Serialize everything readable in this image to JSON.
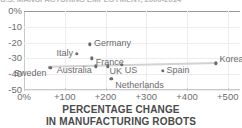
{
  "figure": {
    "title_cut": "U.S. MANUFACTURING EMPLOYMENT, 2000-2014",
    "caption_line1": "PERCENTAGE CHANGE",
    "caption_line2": "IN MANUFACTURING ROBOTS",
    "accent_color": "#6b6b6b",
    "trend_color": "#d2d2d2",
    "grid_color": "#ededed",
    "axis_color": "#c9c9c9"
  },
  "chart_data": {
    "type": "scatter",
    "title": "",
    "xlabel": "PERCENTAGE CHANGE IN MANUFACTURING ROBOTS",
    "ylabel": "",
    "xlim": [
      0,
      530
    ],
    "ylim": [
      -50,
      0
    ],
    "grid": true,
    "legend": "none",
    "xticks": [
      0,
      100,
      200,
      300,
      400,
      500
    ],
    "xticklabels": [
      "0%",
      "+100",
      "+200",
      "+300",
      "+400",
      "+500"
    ],
    "yticks": [
      0,
      -10,
      -20,
      -30,
      -40,
      -50
    ],
    "yticklabels": [
      "0%",
      "-10",
      "-20",
      "-30",
      "-40",
      "-50"
    ],
    "points": [
      {
        "name": "Sweden",
        "x": 65,
        "y": -36,
        "label_side": "left",
        "label_dx": -4,
        "label_dy": 5
      },
      {
        "name": "Italy",
        "x": 130,
        "y": -27,
        "label_side": "left",
        "label_dx": -4,
        "label_dy": -1
      },
      {
        "name": "Germany",
        "x": 162,
        "y": -21,
        "label_side": "right",
        "label_dx": 4,
        "label_dy": -1
      },
      {
        "name": "France",
        "x": 166,
        "y": -30,
        "label_side": "right",
        "label_dx": 4,
        "label_dy": 4
      },
      {
        "name": "Australia",
        "x": 176,
        "y": -35,
        "label_side": "left",
        "label_dx": -4,
        "label_dy": 4
      },
      {
        "name": "UK",
        "x": 205,
        "y": -35,
        "label_side": "right",
        "label_dx": 2,
        "label_dy": 5
      },
      {
        "name": "Netherlands",
        "x": 214,
        "y": -43,
        "label_side": "right",
        "label_dx": 4,
        "label_dy": 6
      },
      {
        "name": "US",
        "x": 240,
        "y": -34,
        "label_side": "right",
        "label_dx": 3,
        "label_dy": 5
      },
      {
        "name": "Spain",
        "x": 340,
        "y": -38,
        "label_side": "right",
        "label_dx": 4,
        "label_dy": -1
      },
      {
        "name": "Korea",
        "x": 470,
        "y": -33,
        "label_side": "right",
        "label_dx": 4,
        "label_dy": -4
      }
    ],
    "trendline": {
      "x0": 60,
      "y0": -35.6,
      "x1": 478,
      "y1": -33.2
    }
  }
}
